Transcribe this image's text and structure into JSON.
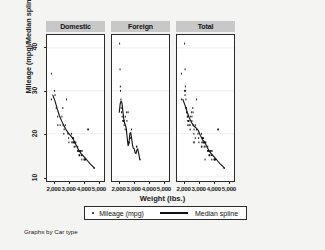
{
  "chart_data": {
    "type": "scatter",
    "title": "",
    "xlabel": "Weight (lbs.)",
    "ylabel": "Mileage (mpg)/Median spline",
    "caption": "Graphs by Car type",
    "grid": true,
    "legend_position": "bottom",
    "xlim": [
      1500,
      5400
    ],
    "ylim": [
      9,
      43
    ],
    "xticks": [
      2000,
      3000,
      4000,
      5000
    ],
    "xticklabels": [
      "2,000",
      "3,000",
      "4,000",
      "5,000"
    ],
    "yticks": [
      10,
      20,
      30,
      40
    ],
    "yticklabels": [
      "10",
      "20",
      "30",
      "40"
    ],
    "legend": [
      {
        "label": "Mileage (mpg)",
        "marker": "dot"
      },
      {
        "label": "Median spline",
        "marker": "line"
      }
    ],
    "panels": [
      {
        "name": "Domestic",
        "scatter": {
          "x": [
            1800,
            1800,
            2020,
            2050,
            2130,
            2230,
            2240,
            2400,
            2520,
            2580,
            2600,
            2650,
            2670,
            2750,
            2830,
            2930,
            2980,
            3000,
            3180,
            3200,
            3250,
            3260,
            3280,
            3300,
            3310,
            3350,
            3360,
            3380,
            3400,
            3420,
            3470,
            3600,
            3600,
            3630,
            3670,
            3690,
            3700,
            3720,
            3740,
            3800,
            3830,
            3850,
            3880,
            3900,
            3900,
            4030,
            4060,
            4080,
            4130,
            4290,
            4330,
            4720
          ],
          "y": [
            34,
            28,
            30,
            29,
            26,
            24,
            22,
            22,
            24,
            26,
            22,
            20,
            21,
            22,
            28,
            20,
            19,
            18,
            20,
            18,
            19,
            19,
            18,
            18,
            19,
            18,
            17,
            18,
            18,
            17,
            18,
            16,
            17,
            16,
            16,
            15,
            16,
            15,
            15,
            16,
            16,
            15,
            14,
            15,
            16,
            14,
            14,
            14,
            14,
            21,
            21,
            12
          ]
        },
        "spline": {
          "x": [
            1900,
            2050,
            2200,
            2350,
            2500,
            2650,
            2800,
            2950,
            3100,
            3250,
            3400,
            3550,
            3700,
            3850,
            4000,
            4150,
            4300,
            4450,
            4600,
            4750
          ],
          "y": [
            29.0,
            27.6,
            25.8,
            24.2,
            23.0,
            21.9,
            21.0,
            20.2,
            19.6,
            19.0,
            18.0,
            17.0,
            16.0,
            15.3,
            14.8,
            14.2,
            13.6,
            13.0,
            12.5,
            12.0
          ]
        }
      },
      {
        "name": "Foreign",
        "scatter": {
          "x": [
            2020,
            2050,
            2070,
            2080,
            2110,
            2130,
            2150,
            2160,
            2200,
            2240,
            2280,
            2300,
            2310,
            2330,
            2400,
            2410,
            2500,
            2520,
            2600,
            2650,
            2670,
            2750,
            2830,
            3170,
            3200,
            3420
          ],
          "y": [
            41,
            35,
            31,
            30,
            28,
            26,
            25,
            25,
            24,
            23,
            23,
            23,
            23,
            22,
            21,
            24,
            25,
            23,
            25,
            18,
            18,
            19,
            21,
            17,
            17,
            14
          ]
        },
        "spline": {
          "x": [
            2000,
            2060,
            2120,
            2180,
            2240,
            2300,
            2360,
            2420,
            2480,
            2540,
            2600,
            2660,
            2720,
            2780,
            2840,
            2900,
            2960,
            3020,
            3080,
            3140,
            3200,
            3260,
            3320,
            3400
          ],
          "y": [
            25.0,
            27.0,
            27.6,
            27.2,
            25.4,
            23.6,
            22.5,
            22.0,
            21.2,
            19.0,
            17.2,
            17.8,
            20.0,
            20.3,
            19.0,
            17.4,
            16.6,
            16.5,
            15.6,
            15.4,
            16.2,
            16.5,
            15.5,
            14.0
          ]
        }
      },
      {
        "name": "Total",
        "scatter": {
          "x": [
            1800,
            1800,
            2020,
            2020,
            2050,
            2050,
            2070,
            2080,
            2110,
            2130,
            2130,
            2150,
            2160,
            2200,
            2230,
            2240,
            2240,
            2280,
            2300,
            2310,
            2330,
            2400,
            2400,
            2410,
            2500,
            2520,
            2520,
            2580,
            2600,
            2600,
            2650,
            2650,
            2670,
            2670,
            2750,
            2750,
            2830,
            2830,
            2930,
            2980,
            3000,
            3170,
            3180,
            3200,
            3200,
            3250,
            3260,
            3280,
            3300,
            3310,
            3350,
            3360,
            3380,
            3400,
            3420,
            3420,
            3470,
            3600,
            3600,
            3630,
            3670,
            3690,
            3700,
            3720,
            3740,
            3800,
            3830,
            3850,
            3880,
            3900,
            3900,
            4030,
            4060,
            4080,
            4130,
            4290,
            4330,
            4720
          ],
          "y": [
            34,
            28,
            41,
            30,
            35,
            29,
            31,
            30,
            28,
            26,
            26,
            25,
            25,
            24,
            24,
            23,
            22,
            23,
            23,
            23,
            22,
            21,
            22,
            24,
            25,
            23,
            24,
            26,
            25,
            22,
            18,
            20,
            18,
            21,
            19,
            22,
            21,
            28,
            20,
            19,
            18,
            17,
            20,
            17,
            18,
            19,
            19,
            18,
            18,
            19,
            18,
            17,
            18,
            18,
            14,
            17,
            18,
            16,
            17,
            16,
            16,
            15,
            16,
            15,
            15,
            16,
            16,
            15,
            14,
            15,
            16,
            14,
            14,
            14,
            14,
            21,
            21,
            12
          ]
        },
        "spline": {
          "x": [
            1900,
            2050,
            2200,
            2350,
            2500,
            2650,
            2800,
            2950,
            3100,
            3250,
            3400,
            3550,
            3700,
            3850,
            4000,
            4150,
            4300,
            4450,
            4600,
            4750
          ],
          "y": [
            28.0,
            26.6,
            25.0,
            23.6,
            22.6,
            21.8,
            21.4,
            20.8,
            19.6,
            18.6,
            18.0,
            17.0,
            16.0,
            15.3,
            14.8,
            14.2,
            13.6,
            13.0,
            12.5,
            12.0
          ]
        }
      }
    ],
    "colors": {
      "marker": "#101010",
      "spline": "#101010",
      "panel_header_bg": "#c8c8c8",
      "plot_bg": "#ffffff",
      "figure_bg": "#f4f4f2",
      "frame": "#2b2b2b",
      "grid": "#e8e8e8"
    }
  }
}
